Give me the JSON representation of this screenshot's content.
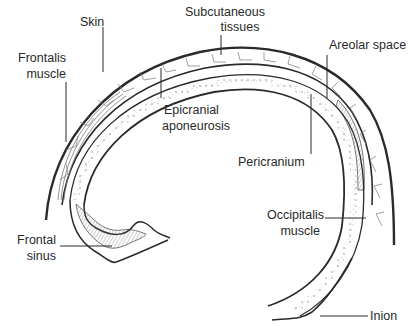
{
  "diagram": {
    "labels": {
      "skin": "Skin",
      "subcutaneous_1": "Subcutaneous",
      "subcutaneous_2": "tissues",
      "frontalis_1": "Frontalis",
      "frontalis_2": "muscle",
      "epicranial_1": "Epicranial",
      "epicranial_2": "aponeurosis",
      "areolar": "Areolar space",
      "pericranium": "Pericranium",
      "occipitalis_1": "Occipitalis",
      "occipitalis_2": "muscle",
      "frontal_sinus_1": "Frontal",
      "frontal_sinus_2": "sinus",
      "inion": "Inion"
    },
    "colors": {
      "line": "#2a2a2a",
      "fill_muscle": "#bdbdbd",
      "fill_sinus": "#c8c8c8",
      "background": "#ffffff"
    }
  }
}
